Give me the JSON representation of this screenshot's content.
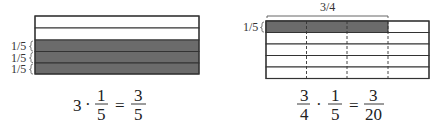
{
  "colors": {
    "shaded": "#6b6b6b",
    "grid_line": "#555555",
    "outline": "#333333"
  },
  "left_figure": {
    "rows": 5,
    "shaded_rows": 3,
    "row_labels": [
      "1/5",
      "1/5",
      "1/5"
    ],
    "equation": {
      "whole": "3",
      "dot": "·",
      "frac1_num": "1",
      "frac1_den": "5",
      "equals": "=",
      "result_num": "3",
      "result_den": "5"
    }
  },
  "right_figure": {
    "rows": 5,
    "columns": 4,
    "shaded_row": 1,
    "shaded_columns": 3,
    "top_brace_label": "3/4",
    "row_label": "1/5",
    "equation": {
      "frac1_num": "3",
      "frac1_den": "4",
      "dot": "·",
      "frac2_num": "1",
      "frac2_den": "5",
      "equals": "=",
      "result_num": "3",
      "result_den": "20"
    }
  }
}
